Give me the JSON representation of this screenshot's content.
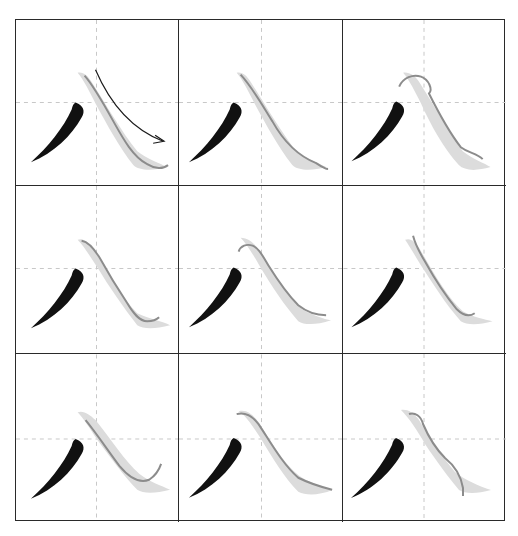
{
  "figure": {
    "type": "calligraphy-practice-grid",
    "character": "八",
    "rows": 3,
    "columns": 3,
    "colors": {
      "border": "#2a2a2a",
      "guide_dash": "#c8c8c8",
      "model_stroke": "#111111",
      "trace_fill": "#d9d9d9",
      "trace_line": "#8a8a8a",
      "arrow": "#1a1a1a"
    },
    "cells": [
      {
        "id": 1,
        "has_direction_arrow": true,
        "trace_variant": "standard"
      },
      {
        "id": 2,
        "has_direction_arrow": false,
        "trace_variant": "standard"
      },
      {
        "id": 3,
        "has_direction_arrow": false,
        "trace_variant": "hook-top"
      },
      {
        "id": 4,
        "has_direction_arrow": false,
        "trace_variant": "standard"
      },
      {
        "id": 5,
        "has_direction_arrow": false,
        "trace_variant": "hook-top"
      },
      {
        "id": 6,
        "has_direction_arrow": false,
        "trace_variant": "standard"
      },
      {
        "id": 7,
        "has_direction_arrow": false,
        "trace_variant": "curl-end"
      },
      {
        "id": 8,
        "has_direction_arrow": false,
        "trace_variant": "standard"
      },
      {
        "id": 9,
        "has_direction_arrow": false,
        "trace_variant": "s-curve"
      }
    ]
  }
}
